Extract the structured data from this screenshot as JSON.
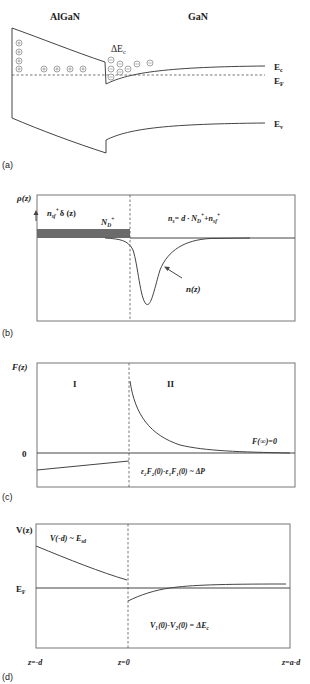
{
  "panels": {
    "a": {
      "label": "(a)",
      "material_left": "AlGaN",
      "material_right": "GaN",
      "delta_ec": "ΔE",
      "delta_ec_sub": "c",
      "ec": "E",
      "ec_sub": "c",
      "ef": "E",
      "ef_sub": "F",
      "ev": "E",
      "ev_sub": "v",
      "ion_symbols": {
        "positive": "+",
        "negative": "−"
      }
    },
    "b": {
      "label": "(b)",
      "ylabel": "ρ(z)",
      "delta_term": "n",
      "delta_term_sub": "sf",
      "delta_term_sup": "+",
      "delta_term_tail": "δ (z)",
      "nd": "N",
      "nd_sub": "D",
      "nd_sup": "+",
      "ns_eq_pre": "n",
      "ns_eq_sub": "s",
      "ns_eq_mid": "= d · N",
      "ns_eq_sub2": "D",
      "ns_eq_sup2": "+",
      "ns_eq_plus": "+n",
      "ns_eq_sub3": "sf",
      "ns_eq_sup3": "+",
      "nz": "n(z)"
    },
    "c": {
      "label": "(c)",
      "ylabel": "F(z)",
      "zero": "0",
      "region1": "I",
      "region2": "II",
      "finf": "F(∞)=0",
      "boundary_eq": "ε₂F₂(0)-ε₁F₁(0) ~ ΔP"
    },
    "d": {
      "label": "(d)",
      "ylabel": "V(z)",
      "ef": "E",
      "ef_sub": "F",
      "vd": "V(-d) ~ E",
      "vd_sub": "sd",
      "boundary_eq": "V₁(0)-V₂(0) = ΔE",
      "boundary_eq_sub": "c",
      "xticks": [
        "z=-d",
        "z=0",
        "z=a-d"
      ]
    }
  }
}
